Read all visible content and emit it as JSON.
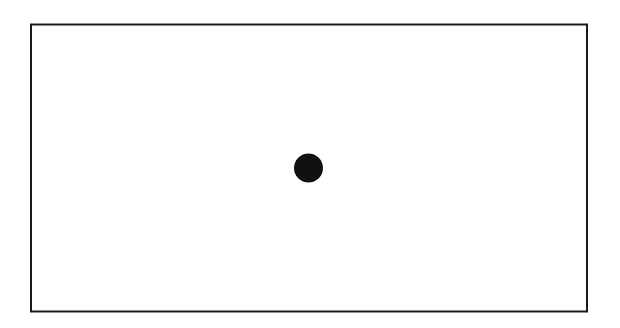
{
  "diagram": {
    "shapes": [
      {
        "kind": "rectangle",
        "name": "frame",
        "filled": false
      },
      {
        "kind": "circle",
        "name": "center-dot",
        "filled": true
      }
    ],
    "colors": {
      "background": "#ffffff",
      "stroke": "#1a1a1a",
      "dot_fill": "#111111"
    }
  }
}
